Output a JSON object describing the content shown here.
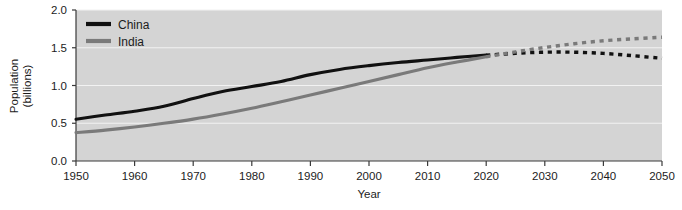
{
  "chart_data": {
    "type": "line",
    "title": "",
    "xlabel": "Year",
    "ylabel": "Population (billions)",
    "ylabel_line1": "Population",
    "ylabel_line2": "(billions)",
    "xlim": [
      1950,
      2050
    ],
    "ylim": [
      0.0,
      2.0
    ],
    "grid": true,
    "grid_axis": "y",
    "legend_position": "top-left",
    "projection_start_year": 2020,
    "projection_note": "Solid lines are historical data; dotted lines are projections from 2020 onward.",
    "xticks": [
      1950,
      1960,
      1970,
      1980,
      1990,
      2000,
      2010,
      2020,
      2030,
      2040,
      2050
    ],
    "xticklabels": [
      "1950",
      "1960",
      "1970",
      "1980",
      "1990",
      "2000",
      "2010",
      "2020",
      "2030",
      "2040",
      "2050"
    ],
    "yticks": [
      0.0,
      0.5,
      1.0,
      1.5,
      2.0
    ],
    "yticklabels": [
      "0.0",
      "0.5",
      "1.0",
      "1.5",
      "2.0"
    ],
    "x": [
      1950,
      1955,
      1960,
      1965,
      1970,
      1975,
      1980,
      1985,
      1990,
      1995,
      2000,
      2005,
      2010,
      2015,
      2020,
      2025,
      2030,
      2035,
      2040,
      2045,
      2050
    ],
    "series": [
      {
        "name": "China",
        "color": "#111111",
        "values": [
          0.554,
          0.609,
          0.66,
          0.724,
          0.827,
          0.921,
          0.986,
          1.053,
          1.144,
          1.213,
          1.263,
          1.304,
          1.338,
          1.372,
          1.402,
          1.426,
          1.441,
          1.441,
          1.425,
          1.395,
          1.36
        ],
        "historical_end": 2020,
        "projected_values": [
          1.402,
          1.426,
          1.441,
          1.441,
          1.425,
          1.395,
          1.36
        ]
      },
      {
        "name": "India",
        "color": "#7a7a7a",
        "values": [
          0.376,
          0.409,
          0.45,
          0.499,
          0.555,
          0.623,
          0.699,
          0.785,
          0.873,
          0.964,
          1.053,
          1.144,
          1.234,
          1.31,
          1.38,
          1.445,
          1.504,
          1.553,
          1.592,
          1.618,
          1.639
        ],
        "historical_end": 2020,
        "projected_values": [
          1.38,
          1.445,
          1.504,
          1.553,
          1.592,
          1.618,
          1.639
        ]
      }
    ]
  },
  "legend": {
    "items": [
      {
        "label": "China",
        "color": "#111111"
      },
      {
        "label": "India",
        "color": "#7a7a7a"
      }
    ]
  },
  "style": {
    "plot_background": "#d4d4d4",
    "figure_background": "#ffffff",
    "gridline_color": "#f2f2f2",
    "axis_color": "#3a3a3a",
    "tick_color": "#3a3a3a",
    "china_color": "#111111",
    "india_color": "#7a7a7a"
  }
}
